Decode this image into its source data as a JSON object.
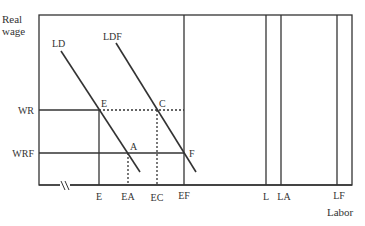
{
  "diagram": {
    "y_axis_title_line1": "Real",
    "y_axis_title_line2": "wage",
    "x_axis_title": "Labor",
    "curves": {
      "ld": "LD",
      "ldf": "LDF"
    },
    "y_ticks": {
      "wr": "WR",
      "wrf": "WRF"
    },
    "points": {
      "e": "E",
      "c": "C",
      "a": "A",
      "f": "F"
    },
    "x_ticks": {
      "e": "E",
      "ea": "EA",
      "ec": "EC",
      "ef": "EF",
      "l": "L",
      "la": "LA",
      "lf": "LF"
    },
    "colors": {
      "line": "#333333",
      "background": "#ffffff"
    }
  }
}
